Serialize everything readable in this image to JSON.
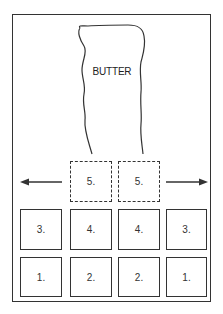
{
  "diagram": {
    "butter_label": "BUTTER",
    "direction_arrows": [
      "left",
      "right"
    ],
    "dashed_row": [
      {
        "label": "5."
      },
      {
        "label": "5."
      }
    ],
    "row_top": [
      {
        "label": "3."
      },
      {
        "label": "4."
      },
      {
        "label": "4."
      },
      {
        "label": "3."
      }
    ],
    "row_bottom": [
      {
        "label": "1."
      },
      {
        "label": "2."
      },
      {
        "label": "2."
      },
      {
        "label": "1."
      }
    ],
    "colors": {
      "line": "#333333",
      "background": "#ffffff"
    }
  }
}
